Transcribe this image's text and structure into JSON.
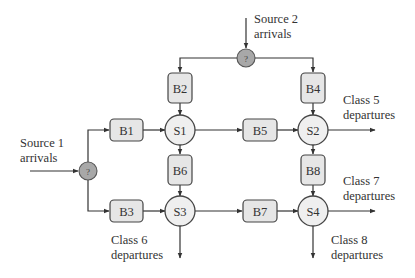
{
  "diagram": {
    "type": "queueing-network",
    "colors": {
      "buffer_fill": "#e6e6e6",
      "server_fill": "#efefef",
      "router_fill": "#a8a8a8",
      "stroke": "#333333"
    },
    "sources": [
      {
        "id": "source1",
        "line1": "Source 1",
        "line2": "arrivals"
      },
      {
        "id": "source2",
        "line1": "Source 2",
        "line2": "arrivals"
      }
    ],
    "routers": [
      {
        "id": "router1",
        "label": "?"
      },
      {
        "id": "router2",
        "label": "?"
      }
    ],
    "buffers": [
      {
        "id": "B1",
        "label": "B1"
      },
      {
        "id": "B2",
        "label": "B2"
      },
      {
        "id": "B3",
        "label": "B3"
      },
      {
        "id": "B4",
        "label": "B4"
      },
      {
        "id": "B5",
        "label": "B5"
      },
      {
        "id": "B6",
        "label": "B6"
      },
      {
        "id": "B7",
        "label": "B7"
      },
      {
        "id": "B8",
        "label": "B8"
      }
    ],
    "servers": [
      {
        "id": "S1",
        "label": "S1"
      },
      {
        "id": "S2",
        "label": "S2"
      },
      {
        "id": "S3",
        "label": "S3"
      },
      {
        "id": "S4",
        "label": "S4"
      }
    ],
    "departures": [
      {
        "id": "class5",
        "line1": "Class 5",
        "line2": "departures"
      },
      {
        "id": "class6",
        "line1": "Class 6",
        "line2": "departures"
      },
      {
        "id": "class7",
        "line1": "Class 7",
        "line2": "departures"
      },
      {
        "id": "class8",
        "line1": "Class 8",
        "line2": "departures"
      }
    ],
    "edges": [
      [
        "source1",
        "router1"
      ],
      [
        "router1",
        "B1"
      ],
      [
        "router1",
        "B3"
      ],
      [
        "source2",
        "router2"
      ],
      [
        "router2",
        "B2"
      ],
      [
        "router2",
        "B4"
      ],
      [
        "B1",
        "S1"
      ],
      [
        "B2",
        "S1"
      ],
      [
        "S1",
        "B5"
      ],
      [
        "S1",
        "B6"
      ],
      [
        "B5",
        "S2"
      ],
      [
        "B4",
        "S2"
      ],
      [
        "S2",
        "class5"
      ],
      [
        "S2",
        "B8"
      ],
      [
        "B3",
        "S3"
      ],
      [
        "B6",
        "S3"
      ],
      [
        "S3",
        "B7"
      ],
      [
        "S3",
        "class6"
      ],
      [
        "B7",
        "S4"
      ],
      [
        "B8",
        "S4"
      ],
      [
        "S4",
        "class7"
      ],
      [
        "S4",
        "class8"
      ]
    ]
  }
}
